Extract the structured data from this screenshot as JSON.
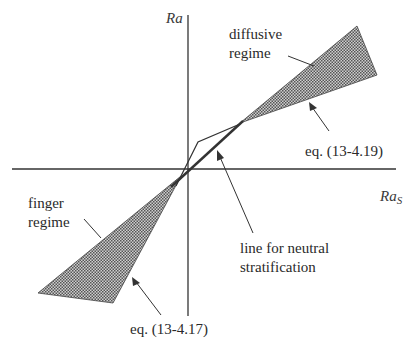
{
  "diagram": {
    "axes": {
      "y_label": "Ra",
      "x_label_main": "Ra",
      "x_label_sub": "S"
    },
    "labels": {
      "diffusive_1": "diffusive",
      "diffusive_2": "regime",
      "finger_1": "finger",
      "finger_2": "regime",
      "eq_upper": "eq. (13-4.19)",
      "eq_lower": "eq. (13-4.17)",
      "neutral_1": "line for neutral",
      "neutral_2": "stratification"
    },
    "colors": {
      "line": "#333333",
      "hatch": "#555555",
      "background": "#ffffff"
    }
  }
}
